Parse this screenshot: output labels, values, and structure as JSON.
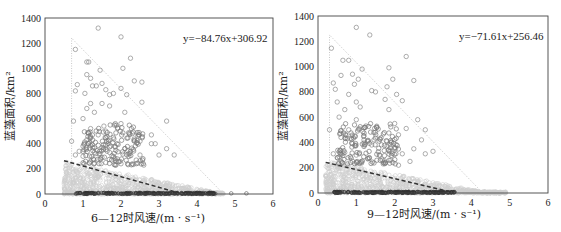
{
  "chart_data": [
    {
      "type": "scatter",
      "title": "",
      "xlabel": "6—12时风速/(m·s⁻¹)",
      "ylabel": "蓝藻面积/km²",
      "xlim": [
        0,
        6
      ],
      "ylim": [
        0,
        1400
      ],
      "xticks": [
        "0",
        "1",
        "2",
        "3",
        "4",
        "5",
        "6"
      ],
      "yticks": [
        "0",
        "200",
        "400",
        "600",
        "800",
        "1000",
        "1200",
        "1400"
      ],
      "grid": false,
      "regression": {
        "equation": "y=−84.76x+306.92",
        "slope": -84.76,
        "intercept": 306.92,
        "x_range": [
          0.5,
          3.5
        ]
      },
      "envelope": {
        "points": [
          [
            0.7,
            0
          ],
          [
            0.7,
            1240
          ],
          [
            4.7,
            0
          ]
        ]
      },
      "series": [
        {
          "name": "high-bloom",
          "color": "#888888",
          "points": [
            [
              1.4,
              1320
            ],
            [
              2.0,
              1250
            ],
            [
              0.8,
              1150
            ],
            [
              2.25,
              1080
            ],
            [
              1.1,
              1050
            ],
            [
              1.15,
              1050
            ],
            [
              2.05,
              1000
            ],
            [
              1.45,
              985
            ],
            [
              1.1,
              950
            ],
            [
              1.2,
              920
            ],
            [
              2.35,
              900
            ],
            [
              2.55,
              890
            ],
            [
              1.5,
              880
            ],
            [
              0.85,
              870
            ],
            [
              1.25,
              860
            ],
            [
              1.35,
              860
            ],
            [
              2.0,
              840
            ],
            [
              1.6,
              830
            ],
            [
              0.8,
              820
            ],
            [
              1.05,
              800
            ],
            [
              1.7,
              790
            ],
            [
              1.8,
              800
            ],
            [
              2.15,
              790
            ],
            [
              2.55,
              730
            ],
            [
              1.2,
              720
            ],
            [
              1.5,
              720
            ],
            [
              1.7,
              700
            ],
            [
              1.1,
              680
            ],
            [
              2.1,
              650
            ],
            [
              1.3,
              650
            ],
            [
              1.0,
              600
            ],
            [
              3.2,
              580
            ],
            [
              0.75,
              580
            ],
            [
              1.85,
              560
            ],
            [
              2.0,
              560
            ],
            [
              1.55,
              540
            ],
            [
              1.2,
              520
            ],
            [
              1.6,
              500
            ],
            [
              2.3,
              480
            ],
            [
              1.4,
              470
            ],
            [
              2.8,
              470
            ],
            [
              1.8,
              450
            ],
            [
              1.1,
              430
            ],
            [
              0.7,
              420
            ],
            [
              2.5,
              420
            ],
            [
              2.9,
              400
            ],
            [
              2.8,
              400
            ],
            [
              1.0,
              380
            ],
            [
              1.5,
              370
            ],
            [
              2.1,
              360
            ],
            [
              3.2,
              360
            ],
            [
              0.9,
              340
            ],
            [
              1.3,
              330
            ],
            [
              1.7,
              330
            ],
            [
              2.2,
              320
            ],
            [
              2.5,
              310
            ],
            [
              3.0,
              310
            ],
            [
              3.4,
              310
            ],
            [
              1.0,
              300
            ],
            [
              1.5,
              290
            ],
            [
              1.9,
              280
            ],
            [
              2.4,
              270
            ],
            [
              1.2,
              260
            ],
            [
              1.6,
              250
            ],
            [
              2.0,
              240
            ],
            [
              2.3,
              240
            ],
            [
              2.6,
              230
            ],
            [
              0.8,
              310
            ]
          ]
        },
        {
          "name": "low-bloom",
          "color": "#c8c8c8",
          "points": "dense cluster 0–250 km² across 0.5–4.7 m/s"
        },
        {
          "name": "near-zero",
          "color": "#333333",
          "points": "dense band at ~0–10 km² across 0.8–4.5 m/s; outliers at 4.9 and 5.3"
        }
      ]
    },
    {
      "type": "scatter",
      "title": "",
      "xlabel": "9—12时风速/(m·s⁻¹)",
      "ylabel": "蓝藻面积/km²",
      "xlim": [
        0,
        6
      ],
      "ylim": [
        0,
        1400
      ],
      "xticks": [
        "0",
        "1",
        "2",
        "3",
        "4",
        "5",
        "6"
      ],
      "yticks": [
        "0",
        "200",
        "400",
        "600",
        "800",
        "1000",
        "1200",
        "1400"
      ],
      "grid": false,
      "regression": {
        "equation": "y=−71.61x+256.46",
        "slope": -71.61,
        "intercept": 256.46,
        "x_range": [
          0.2,
          3.4
        ]
      },
      "envelope": {
        "points": [
          [
            0.3,
            0
          ],
          [
            0.3,
            1250
          ],
          [
            4.3,
            0
          ]
        ]
      },
      "series": [
        {
          "name": "high-bloom",
          "color": "#888888",
          "points": [
            [
              1.0,
              1310
            ],
            [
              1.35,
              1250
            ],
            [
              0.35,
              1145
            ],
            [
              2.3,
              1080
            ],
            [
              0.65,
              1050
            ],
            [
              0.8,
              1050
            ],
            [
              1.85,
              990
            ],
            [
              1.15,
              980
            ],
            [
              0.9,
              940
            ],
            [
              0.6,
              930
            ],
            [
              1.05,
              900
            ],
            [
              1.95,
              900
            ],
            [
              2.5,
              890
            ],
            [
              0.4,
              870
            ],
            [
              0.95,
              860
            ],
            [
              0.45,
              820
            ],
            [
              1.4,
              810
            ],
            [
              1.5,
              800
            ],
            [
              1.8,
              840
            ],
            [
              2.05,
              780
            ],
            [
              0.8,
              780
            ],
            [
              0.5,
              720
            ],
            [
              1.0,
              720
            ],
            [
              2.2,
              730
            ],
            [
              1.75,
              740
            ],
            [
              0.7,
              660
            ],
            [
              1.1,
              680
            ],
            [
              1.85,
              660
            ],
            [
              0.55,
              600
            ],
            [
              1.0,
              580
            ],
            [
              2.6,
              580
            ],
            [
              2.0,
              550
            ],
            [
              0.3,
              500
            ],
            [
              1.25,
              530
            ],
            [
              2.3,
              510
            ],
            [
              2.8,
              500
            ],
            [
              0.8,
              500
            ],
            [
              1.5,
              480
            ],
            [
              2.1,
              460
            ],
            [
              0.6,
              440
            ],
            [
              2.7,
              420
            ],
            [
              1.2,
              420
            ],
            [
              1.8,
              410
            ],
            [
              0.9,
              390
            ],
            [
              1.4,
              380
            ],
            [
              2.0,
              360
            ],
            [
              2.5,
              350
            ],
            [
              0.4,
              310
            ],
            [
              0.7,
              320
            ],
            [
              1.0,
              300
            ],
            [
              1.6,
              300
            ],
            [
              2.2,
              310
            ],
            [
              2.8,
              310
            ],
            [
              3.0,
              330
            ],
            [
              0.5,
              280
            ],
            [
              1.3,
              270
            ],
            [
              1.9,
              260
            ],
            [
              2.4,
              250
            ],
            [
              1.1,
              240
            ],
            [
              1.7,
              230
            ],
            [
              2.1,
              220
            ]
          ]
        },
        {
          "name": "low-bloom",
          "color": "#c8c8c8",
          "points": "dense cluster 0–250 km² across 0.2–4.9 m/s"
        },
        {
          "name": "near-zero",
          "color": "#333333",
          "points": "dense band at ~0–10 km² across 0.4–3.6 m/s"
        }
      ]
    }
  ],
  "charts": [
    {
      "equation": "y=−84.76x+306.92",
      "xlabel": "6—12时风速/(m · s⁻¹)",
      "ylabel": "蓝藻面积/km²"
    },
    {
      "equation": "y=−71.61x+256.46",
      "xlabel": "9—12时风速/(m · s⁻¹)",
      "ylabel": "蓝藻面积/km²"
    }
  ]
}
